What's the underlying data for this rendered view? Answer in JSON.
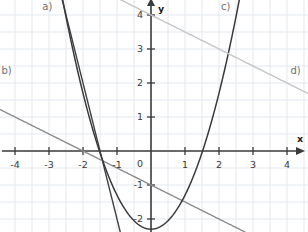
{
  "figure": {
    "width": 308,
    "height": 232,
    "background": "#ffffff"
  },
  "axes": {
    "x_name": "x",
    "y_name": "y",
    "origin_px": {
      "x": 151,
      "y": 151
    },
    "unit_px": 34,
    "axis_color": "#3c3c3c",
    "grid_color": "#e3e8ef",
    "grid_visible": true,
    "grid_step_units": 0.5,
    "xlim": [
      -4.45,
      4.6
    ],
    "ylim": [
      -2.4,
      4.45
    ],
    "x_ticks": [
      -4,
      -3,
      -2,
      -1,
      1,
      2,
      3,
      4
    ],
    "y_ticks": [
      -2,
      -1,
      1,
      2,
      3,
      4
    ],
    "origin_label": "0",
    "x_tick_labels": [
      "-4",
      "-3",
      "-2",
      "-1",
      "1",
      "2",
      "3",
      "4"
    ],
    "y_tick_labels": [
      "-2",
      "-1",
      "1",
      "2",
      "3",
      "4"
    ]
  },
  "chart_data": {
    "type": "line",
    "title": "",
    "xlabel": "x",
    "ylabel": "y",
    "xlim": [
      -4.45,
      4.6
    ],
    "ylim": [
      -2.4,
      4.45
    ],
    "grid": true,
    "legend": "inline-labels",
    "series": [
      {
        "name": "a)",
        "kind": "line",
        "equation": "y = -4x - 6",
        "slope": -4,
        "intercept": -6,
        "color": "#404040",
        "width": 1.4,
        "label": "a)",
        "label_xy": [
          -3.05,
          4.25
        ],
        "x_domain": [
          -2.62,
          -0.52
        ]
      },
      {
        "name": "b)",
        "kind": "line",
        "equation": "y = -0.5x - 1",
        "slope": -0.5,
        "intercept": -1,
        "color": "#8d8d8d",
        "width": 1.4,
        "label": "b)",
        "label_xy": [
          -4.25,
          2.35
        ],
        "x_domain": [
          -4.45,
          2.9
        ]
      },
      {
        "name": "c)",
        "kind": "parabola",
        "equation": "y = x^2 - 2.3",
        "a": 1,
        "b": 0,
        "c": -2.3,
        "vertex": [
          0,
          -2.3
        ],
        "roots": [
          -1.52,
          1.52
        ],
        "color": "#3a3a3a",
        "width": 1.5,
        "label": "c)",
        "label_xy": [
          2.2,
          4.25
        ],
        "x_domain": [
          -2.62,
          2.62
        ]
      },
      {
        "name": "d)",
        "kind": "line",
        "equation": "y = -0.5x + 4",
        "slope": -0.5,
        "intercept": 4,
        "color": "#c6c6c6",
        "width": 1.4,
        "label": "d)",
        "label_xy": [
          4.25,
          2.35
        ],
        "x_domain": [
          -1.6,
          4.6
        ]
      }
    ]
  },
  "labels": {
    "a": "a)",
    "b": "b)",
    "c": "c)",
    "d": "d)"
  }
}
